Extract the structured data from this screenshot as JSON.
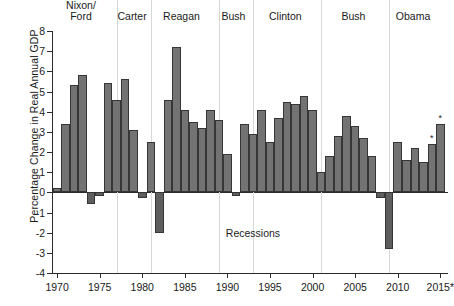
{
  "chart_data": {
    "type": "bar",
    "title": "",
    "xlabel": "",
    "ylabel": "Percentage Change in Real Annual GDP",
    "ylim": [
      -4,
      8
    ],
    "xlim": [
      1969.4,
      2015.9
    ],
    "grid": false,
    "legend": null,
    "y_ticks": [
      8,
      7,
      6,
      5,
      4,
      3,
      2,
      1,
      0,
      -1,
      -2,
      -3,
      -4
    ],
    "y_tick_labels": [
      "8",
      "7",
      "6",
      "5",
      "4",
      "3",
      "2",
      "1",
      "0",
      "-1",
      "-2",
      "-3",
      "-4"
    ],
    "x_ticks": [
      1970,
      1975,
      1980,
      1985,
      1990,
      1995,
      2000,
      2005,
      2010,
      2015
    ],
    "x_tick_labels": [
      "1970",
      "1975",
      "1980",
      "1985",
      "1990",
      "1995",
      "2000",
      "2005",
      "2010",
      "2015*"
    ],
    "categories": [
      1970,
      1971,
      1972,
      1973,
      1974,
      1975,
      1976,
      1977,
      1978,
      1979,
      1980,
      1981,
      1982,
      1983,
      1984,
      1985,
      1986,
      1987,
      1988,
      1989,
      1990,
      1991,
      1992,
      1993,
      1994,
      1995,
      1996,
      1997,
      1998,
      1999,
      2000,
      2001,
      2002,
      2003,
      2004,
      2005,
      2006,
      2007,
      2008,
      2009,
      2010,
      2011,
      2012,
      2013,
      2014,
      2015
    ],
    "values": [
      0.2,
      3.4,
      5.3,
      5.8,
      -0.6,
      -0.2,
      5.4,
      4.6,
      5.6,
      3.1,
      -0.3,
      2.5,
      -2.0,
      4.6,
      7.2,
      4.1,
      3.5,
      3.2,
      4.1,
      3.6,
      1.9,
      -0.2,
      3.4,
      2.9,
      4.1,
      2.5,
      3.7,
      4.5,
      4.4,
      4.8,
      4.1,
      1.0,
      1.8,
      2.8,
      3.8,
      3.3,
      2.7,
      1.8,
      -0.3,
      -2.8,
      2.5,
      1.6,
      2.2,
      1.5,
      2.4,
      3.4
    ],
    "annotated_points": [
      {
        "x": 2014,
        "label": "*"
      },
      {
        "x": 2015,
        "label": "*"
      }
    ],
    "annotations": [
      {
        "text": "Recessions",
        "x": 1993,
        "y": -2.0
      }
    ],
    "presidential_terms": [
      {
        "label_line1": "Nixon/",
        "label_line2": "Ford",
        "start": 1969.4,
        "end": 1977.0,
        "center": 1972.8
      },
      {
        "label_line1": "Carter",
        "label_line2": "",
        "start": 1977.0,
        "end": 1981.0,
        "center": 1978.8
      },
      {
        "label_line1": "Reagan",
        "label_line2": "",
        "start": 1981.0,
        "end": 1989.0,
        "center": 1984.6
      },
      {
        "label_line1": "Bush",
        "label_line2": "",
        "start": 1989.0,
        "end": 1993.0,
        "center": 1990.7
      },
      {
        "label_line1": "Clinton",
        "label_line2": "",
        "start": 1993.0,
        "end": 2001.0,
        "center": 1996.8
      },
      {
        "label_line1": "Bush",
        "label_line2": "",
        "start": 2001.0,
        "end": 2009.0,
        "center": 2004.8
      },
      {
        "label_line1": "Obama",
        "label_line2": "",
        "start": 2009.0,
        "end": 2015.9,
        "center": 2011.8
      }
    ],
    "bar_color": "#737373",
    "bar_negative_color": "#5e5e5e",
    "bar_edge_color": "#363636",
    "axis_color": "#2b2b2b",
    "divider_color": "#d8d8d8"
  }
}
